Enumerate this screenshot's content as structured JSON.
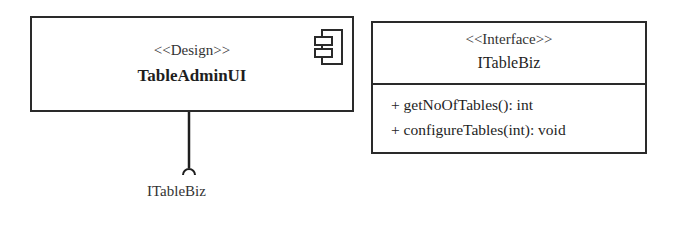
{
  "component": {
    "stereotype": "<<Design>>",
    "name": "TableAdminUI",
    "icon": "uml-component-icon",
    "required_interface": "ITableBiz"
  },
  "interface": {
    "stereotype": "<<Interface>>",
    "name": "ITableBiz",
    "operations": [
      "+ getNoOfTables(): int",
      "+ configureTables(int): void"
    ]
  },
  "colors": {
    "line": "#2a2a2a",
    "background": "#ffffff"
  }
}
